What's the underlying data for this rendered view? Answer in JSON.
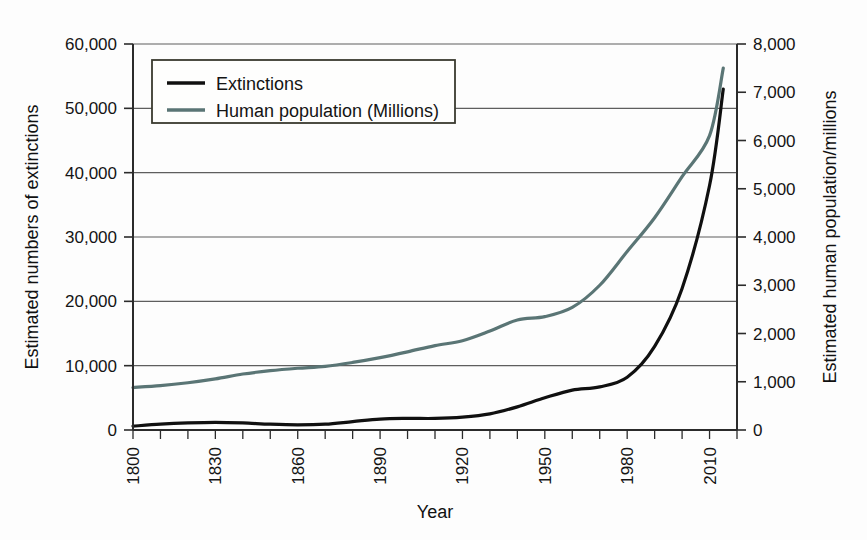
{
  "chart_data": {
    "type": "line",
    "title": "",
    "xlabel": "Year",
    "ylabel": "Estimated numbers of extinctions",
    "ylabel_right": "Estimated human population/millions",
    "xlim": [
      1800,
      2020
    ],
    "ylim": [
      0,
      60000
    ],
    "ylim_right": [
      0,
      8000
    ],
    "grid": true,
    "legend_position": "top-left-inside",
    "x_tick_labels": [
      "1800",
      "1830",
      "1860",
      "1890",
      "1920",
      "1950",
      "1980",
      "2010"
    ],
    "x_tick_values": [
      1800,
      1830,
      1860,
      1890,
      1920,
      1950,
      1980,
      2010
    ],
    "x_minor_step": 10,
    "y_tick_labels": [
      "0",
      "10,000",
      "20,000",
      "30,000",
      "40,000",
      "50,000",
      "60,000"
    ],
    "y_tick_values": [
      0,
      10000,
      20000,
      30000,
      40000,
      50000,
      60000
    ],
    "y_right_tick_labels": [
      "0",
      "1,000",
      "2,000",
      "3,000",
      "4,000",
      "5,000",
      "6,000",
      "7,000",
      "8,000"
    ],
    "y_right_tick_values": [
      0,
      1000,
      2000,
      3000,
      4000,
      5000,
      6000,
      7000,
      8000
    ],
    "colors": {
      "extinctions": "#101010",
      "human_population": "#5a7575",
      "gridline": "#5e5e5e",
      "axis": "#2b2b2b",
      "background": "#fdfdfd"
    },
    "series": [
      {
        "name": "Extinctions",
        "axis": "left",
        "color": "#101010",
        "x": [
          1800,
          1810,
          1820,
          1830,
          1840,
          1850,
          1860,
          1870,
          1880,
          1890,
          1900,
          1910,
          1920,
          1930,
          1940,
          1950,
          1960,
          1970,
          1980,
          1990,
          2000,
          2010,
          2015
        ],
        "values": [
          600,
          900,
          1100,
          1200,
          1100,
          900,
          800,
          900,
          1300,
          1700,
          1800,
          1800,
          2000,
          2500,
          3600,
          5000,
          6200,
          6700,
          8200,
          13000,
          22000,
          38000,
          53000
        ]
      },
      {
        "name": "Human population (Millions)",
        "axis": "right",
        "color": "#5a7575",
        "x": [
          1800,
          1810,
          1820,
          1830,
          1840,
          1850,
          1860,
          1870,
          1880,
          1890,
          1900,
          1910,
          1920,
          1930,
          1940,
          1950,
          1960,
          1970,
          1980,
          1990,
          2000,
          2010,
          2015
        ],
        "values": [
          880,
          920,
          980,
          1060,
          1160,
          1230,
          1280,
          1320,
          1400,
          1500,
          1620,
          1750,
          1850,
          2050,
          2280,
          2350,
          2540,
          3000,
          3700,
          4400,
          5250,
          6100,
          7500
        ]
      }
    ],
    "legend": [
      {
        "label": "Extinctions",
        "color": "#101010"
      },
      {
        "label": "Human population (Millions)",
        "color": "#5a7575"
      }
    ]
  }
}
